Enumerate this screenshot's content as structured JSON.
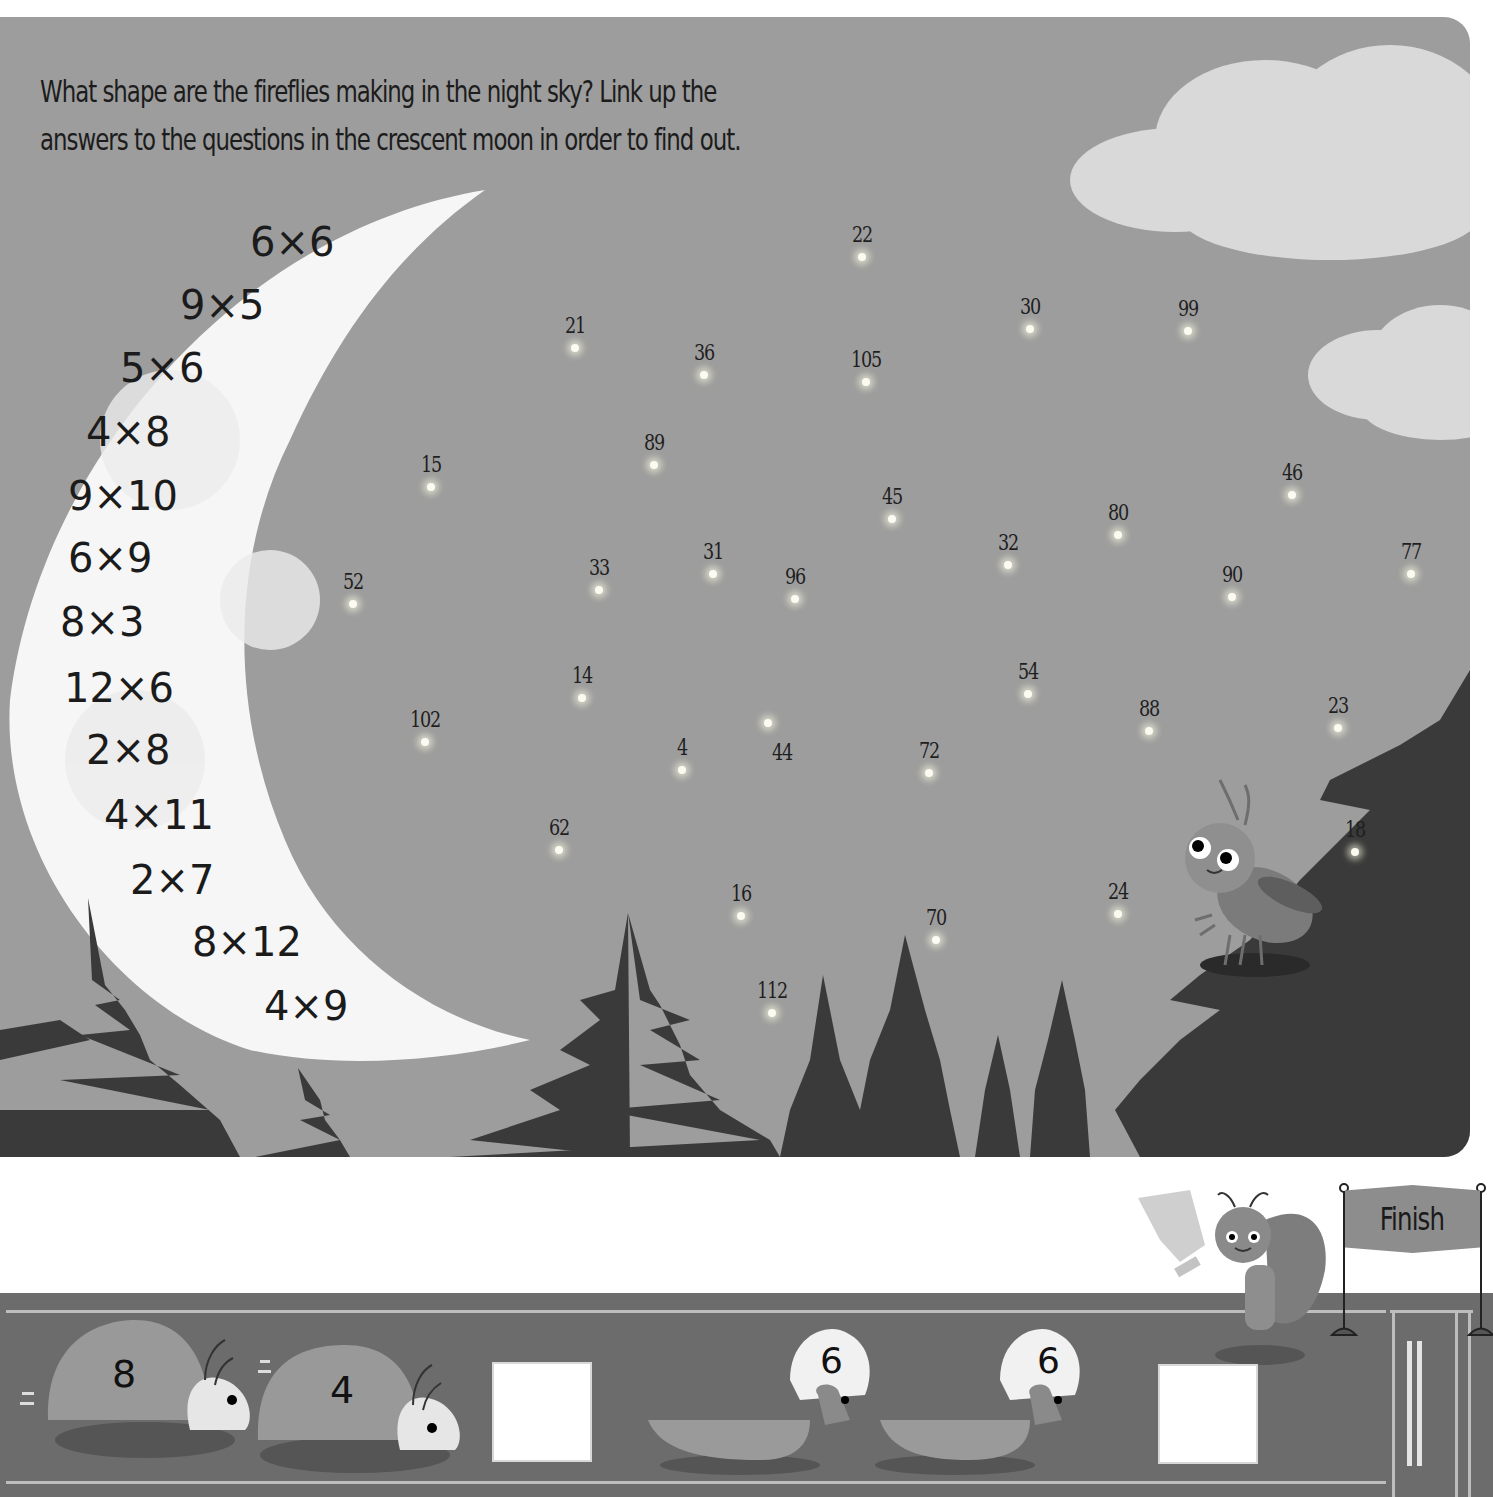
{
  "instructions": {
    "line1": "What shape are the fireflies making in the night sky? Link up the",
    "line2": "answers to the questions in the crescent moon in order to find out."
  },
  "moon": {
    "questions": [
      {
        "text": "6x6",
        "x": 250,
        "y": 222
      },
      {
        "text": "9x5",
        "x": 180,
        "y": 285
      },
      {
        "text": "5x6",
        "x": 120,
        "y": 348
      },
      {
        "text": "4x8",
        "x": 86,
        "y": 412
      },
      {
        "text": "9x10",
        "x": 68,
        "y": 476
      },
      {
        "text": "6x9",
        "x": 68,
        "y": 538
      },
      {
        "text": "8x3",
        "x": 60,
        "y": 602
      },
      {
        "text": "12x6",
        "x": 64,
        "y": 668
      },
      {
        "text": "2x8",
        "x": 86,
        "y": 730
      },
      {
        "text": "4x11",
        "x": 104,
        "y": 795
      },
      {
        "text": "2x7",
        "x": 130,
        "y": 860
      },
      {
        "text": "8x12",
        "x": 192,
        "y": 922
      },
      {
        "text": "4x9",
        "x": 264,
        "y": 986
      }
    ]
  },
  "fireflies": [
    {
      "label": "22",
      "x": 862,
      "y": 257
    },
    {
      "label": "30",
      "x": 1030,
      "y": 329
    },
    {
      "label": "99",
      "x": 1188,
      "y": 331
    },
    {
      "label": "21",
      "x": 575,
      "y": 348
    },
    {
      "label": "36",
      "x": 704,
      "y": 375
    },
    {
      "label": "105",
      "x": 866,
      "y": 382
    },
    {
      "label": "89",
      "x": 654,
      "y": 465
    },
    {
      "label": "15",
      "x": 431,
      "y": 487
    },
    {
      "label": "45",
      "x": 892,
      "y": 519
    },
    {
      "label": "46",
      "x": 1292,
      "y": 495
    },
    {
      "label": "80",
      "x": 1118,
      "y": 535
    },
    {
      "label": "32",
      "x": 1008,
      "y": 565
    },
    {
      "label": "77",
      "x": 1411,
      "y": 574
    },
    {
      "label": "33",
      "x": 599,
      "y": 590
    },
    {
      "label": "31",
      "x": 713,
      "y": 574
    },
    {
      "label": "96",
      "x": 795,
      "y": 599
    },
    {
      "label": "90",
      "x": 1232,
      "y": 597
    },
    {
      "label": "52",
      "x": 353,
      "y": 604
    },
    {
      "label": "14",
      "x": 582,
      "y": 698
    },
    {
      "label": "54",
      "x": 1028,
      "y": 694
    },
    {
      "label": "88",
      "x": 1149,
      "y": 731
    },
    {
      "label": "23",
      "x": 1338,
      "y": 728
    },
    {
      "label": "102",
      "x": 425,
      "y": 742
    },
    {
      "label": "44",
      "x": 768,
      "y": 723,
      "label_dx": 14,
      "label_dy": 52
    },
    {
      "label": "4",
      "x": 682,
      "y": 770
    },
    {
      "label": "72",
      "x": 929,
      "y": 773
    },
    {
      "label": "62",
      "x": 559,
      "y": 850
    },
    {
      "label": "18",
      "x": 1355,
      "y": 852
    },
    {
      "label": "16",
      "x": 741,
      "y": 916
    },
    {
      "label": "24",
      "x": 1118,
      "y": 914
    },
    {
      "label": "70",
      "x": 936,
      "y": 940
    },
    {
      "label": "112",
      "x": 772,
      "y": 1013
    }
  ],
  "race": {
    "group1": {
      "shells": [
        "8",
        "4"
      ],
      "answer": ""
    },
    "group2": {
      "helmets": [
        "6",
        "6"
      ],
      "answer": ""
    },
    "finish_label": "Finish"
  },
  "colors": {
    "sky": "#9d9d9d",
    "moon": "#f7f7f7",
    "trees": "#3a3a3a",
    "track": "#6c6c6c"
  }
}
